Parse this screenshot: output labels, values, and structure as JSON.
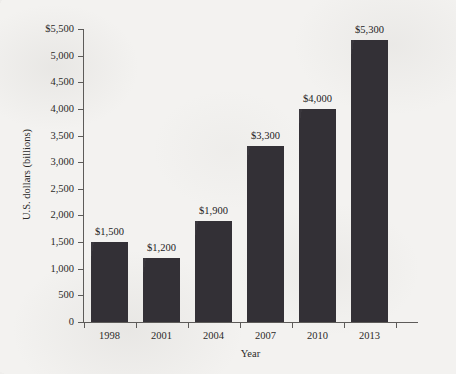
{
  "chart_data": {
    "type": "bar",
    "title": "",
    "xlabel": "Year",
    "ylabel": "U.S. dollars (billions)",
    "categories": [
      "1998",
      "2001",
      "2004",
      "2007",
      "2010",
      "2013"
    ],
    "values": [
      1500,
      1200,
      1900,
      3300,
      4000,
      5300
    ],
    "value_labels": [
      "$1,500",
      "$1,200",
      "$1,900",
      "$3,300",
      "$4,000",
      "$5,300"
    ],
    "ylim": [
      0,
      5500
    ],
    "ytick_values": [
      0,
      500,
      1000,
      1500,
      2000,
      2500,
      3000,
      3500,
      4000,
      4500,
      5000,
      5500
    ],
    "ytick_labels": [
      "0",
      "500",
      "1,000",
      "1,500",
      "2,000",
      "2,500",
      "3,000",
      "3,500",
      "4,000",
      "4,500",
      "5,000",
      "$5,500"
    ],
    "grid": false,
    "legend": false,
    "bar_color": "#333036",
    "axis_color": "#5d5b59",
    "background_color": "#f2f1ef"
  }
}
